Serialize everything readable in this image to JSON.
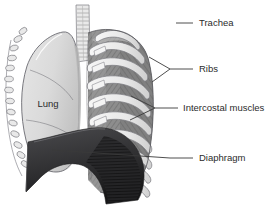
{
  "figure": {
    "background_color": "#ffffff",
    "width": 278,
    "height": 212
  },
  "labels": [
    {
      "id": "trachea",
      "text": "Trachea",
      "text_x": 199,
      "text_y": 23,
      "leader": "M 176 23 L 193 23",
      "leader_type": "single"
    },
    {
      "id": "ribs",
      "text": "Ribs",
      "text_x": 199,
      "text_y": 69,
      "leader": "M 176 69 L 193 69 M 176 69 L 149 57 M 176 69 L 152 82",
      "leader_type": "forked"
    },
    {
      "id": "intercostal-muscles",
      "text": "Intercostal muscles",
      "text_x": 183,
      "text_y": 108,
      "leader": "M 160 108 L 178 108 M 160 108 L 131 96 M 160 108 L 130 120",
      "leader_type": "forked"
    },
    {
      "id": "diaphragm",
      "text": "Diaphragm",
      "text_x": 199,
      "text_y": 158,
      "leader": "M 164 158 L 193 158 M 164 158 L 52 150",
      "leader_type": "single"
    }
  ],
  "inline_labels": [
    {
      "id": "lung",
      "text": "Lung",
      "text_x": 48,
      "text_y": 104
    }
  ],
  "anatomy": {
    "parts": [
      "trachea",
      "lung",
      "ribs",
      "intercostal-muscles",
      "diaphragm",
      "cut-rib-ends",
      "vertebral-column"
    ]
  },
  "colors": {
    "outline": "#55555a",
    "lung_fill": "#dcdcdc",
    "lung_shade": "#c9c9c9",
    "rib_fill": "#efefef",
    "rib_edge": "#9b9b9b",
    "intercostal_fill": "#8d8d8d",
    "intercostal_dark": "#6f6f6f",
    "diaphragm_fill": "#3a3a3c",
    "diaphragm_dark": "#1b1b1d",
    "trachea_fill": "#e4e4e4",
    "trachea_ring": "#9a9a9a",
    "label_text": "#2b2b2b",
    "leader_line": "#3a3a3a",
    "background": "#ffffff"
  }
}
